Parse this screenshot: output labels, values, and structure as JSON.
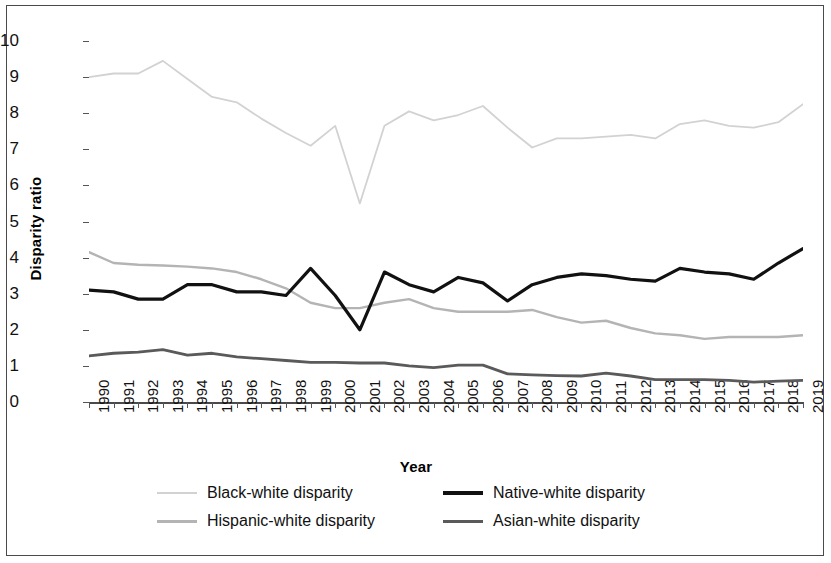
{
  "chart_data": {
    "type": "line",
    "title": "",
    "xlabel": "Year",
    "ylabel": "Disparity ratio",
    "xlim": [
      1990,
      2019
    ],
    "ylim": [
      0,
      10
    ],
    "yticks": [
      0,
      1,
      2,
      3,
      4,
      5,
      6,
      7,
      8,
      9,
      10
    ],
    "grid": false,
    "legend_position": "bottom",
    "x": [
      1990,
      1991,
      1992,
      1993,
      1994,
      1995,
      1996,
      1997,
      1998,
      1999,
      2000,
      2001,
      2002,
      2003,
      2004,
      2005,
      2006,
      2007,
      2008,
      2009,
      2010,
      2011,
      2012,
      2013,
      2014,
      2015,
      2016,
      2017,
      2018,
      2019
    ],
    "categories": [
      "1990",
      "1991",
      "1992",
      "1993",
      "1994",
      "1995",
      "1996",
      "1997",
      "1998",
      "1999",
      "2000",
      "2001",
      "2002",
      "2003",
      "2004",
      "2005",
      "2006",
      "2007",
      "2008",
      "2009",
      "2010",
      "2011",
      "2012",
      "2013",
      "2014",
      "2015",
      "2016",
      "2017",
      "2018",
      "2019"
    ],
    "series": [
      {
        "name": "Black-white disparity",
        "color": "#d2d2d2",
        "width": 1.8,
        "values": [
          9.0,
          9.1,
          9.1,
          9.45,
          8.95,
          8.45,
          8.3,
          7.85,
          7.45,
          7.1,
          7.65,
          5.5,
          7.65,
          8.05,
          7.8,
          7.95,
          8.2,
          7.6,
          7.05,
          7.3,
          7.3,
          7.35,
          7.4,
          7.3,
          7.7,
          7.8,
          7.65,
          7.6,
          7.75,
          8.25
        ]
      },
      {
        "name": "Hispanic-white disparity",
        "color": "#b4b4b4",
        "width": 2.4,
        "values": [
          4.15,
          3.85,
          3.8,
          3.78,
          3.75,
          3.7,
          3.6,
          3.4,
          3.15,
          2.75,
          2.6,
          2.6,
          2.75,
          2.85,
          2.6,
          2.5,
          2.5,
          2.5,
          2.55,
          2.35,
          2.2,
          2.25,
          2.05,
          1.9,
          1.85,
          1.75,
          1.8,
          1.8,
          1.8,
          1.85
        ]
      },
      {
        "name": "Native-white disparity",
        "color": "#111111",
        "width": 3.2,
        "values": [
          3.1,
          3.05,
          2.85,
          2.85,
          3.25,
          3.25,
          3.05,
          3.05,
          2.95,
          3.7,
          2.95,
          2.0,
          3.6,
          3.25,
          3.05,
          3.45,
          3.3,
          2.8,
          3.25,
          3.45,
          3.55,
          3.5,
          3.4,
          3.35,
          3.7,
          3.6,
          3.55,
          3.4,
          3.85,
          4.25
        ]
      },
      {
        "name": "Asian-white disparity",
        "color": "#5a5a5a",
        "width": 2.8,
        "values": [
          1.28,
          1.35,
          1.38,
          1.45,
          1.3,
          1.35,
          1.25,
          1.2,
          1.15,
          1.1,
          1.1,
          1.08,
          1.08,
          1.0,
          0.95,
          1.02,
          1.02,
          0.78,
          0.75,
          0.73,
          0.72,
          0.8,
          0.72,
          0.62,
          0.62,
          0.62,
          0.6,
          0.55,
          0.58,
          0.6
        ]
      }
    ]
  },
  "axes": {
    "y_title": "Disparity ratio",
    "x_title": "Year"
  },
  "legend": {
    "entries": [
      {
        "label": "Black-white disparity",
        "color": "#d2d2d2",
        "thickness": 2
      },
      {
        "label": "Native-white disparity",
        "color": "#111111",
        "thickness": 4
      },
      {
        "label": "Hispanic-white disparity",
        "color": "#b4b4b4",
        "thickness": 3
      },
      {
        "label": "Asian-white disparity",
        "color": "#5a5a5a",
        "thickness": 3
      }
    ]
  }
}
